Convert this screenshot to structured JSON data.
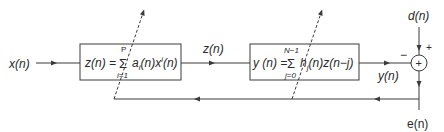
{
  "diagram": {
    "type": "block-diagram",
    "colors": {
      "line": "#3a3a3a",
      "text": "#2a2a2a",
      "background": "#ffffff"
    },
    "signals": {
      "input": "x(n)",
      "intermediate": "z(n)",
      "output": "y(n)",
      "desired": "d(n)",
      "error": "e(n)"
    },
    "blocks": [
      {
        "id": "polynomial-block",
        "lhs": "z(n) =",
        "sum_upper": "P",
        "sum_lower": "i=1",
        "term": "a",
        "term_sub": "i",
        "term_rest": "(n)x",
        "term_sup": "i",
        "term_end": "(n)"
      },
      {
        "id": "fir-block",
        "lhs": "y (n) =",
        "sum_upper": "N−1",
        "sum_lower": "j=0",
        "term": "h",
        "term_sub": "j",
        "term_rest": "(n)z(n−j)"
      }
    ],
    "summer": {
      "symbol": "+",
      "sign_top": "+",
      "sign_left": "−"
    }
  }
}
